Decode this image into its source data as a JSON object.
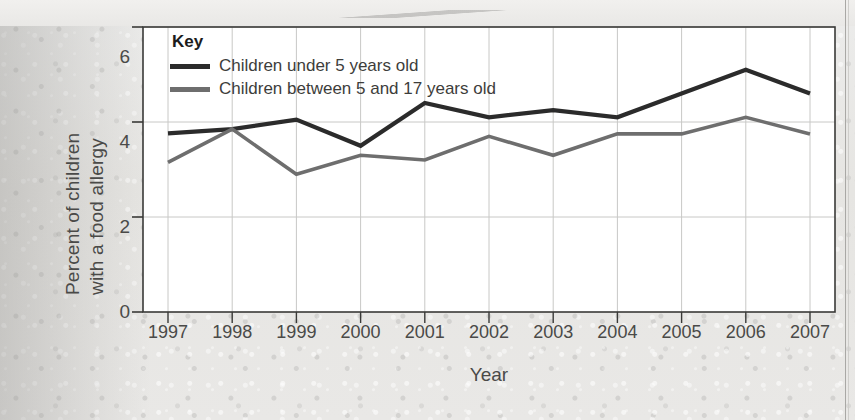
{
  "chart_data": {
    "type": "line",
    "title": "",
    "xlabel": "Year",
    "ylabel": "Percent of children with a food allergy",
    "ylabel_line1": "Percent of children",
    "ylabel_line2": "with a food allergy",
    "categories": [
      "1997",
      "1998",
      "1999",
      "2000",
      "2001",
      "2002",
      "2003",
      "2004",
      "2005",
      "2006",
      "2007"
    ],
    "x": [
      1997,
      1998,
      1999,
      2000,
      2001,
      2002,
      2003,
      2004,
      2005,
      2006,
      2007
    ],
    "ylim": [
      0,
      6
    ],
    "xlim": [
      1997,
      2007
    ],
    "yticks": [
      "0",
      "2",
      "4",
      "6"
    ],
    "ytick_values": [
      0,
      2,
      4,
      6
    ],
    "grid": "both",
    "legend_position": "top-left-inside",
    "legend_title": "Key",
    "series": [
      {
        "name": "Children under 5 years old",
        "color": "#2b2b2b",
        "values": [
          3.76,
          3.85,
          4.05,
          3.5,
          4.4,
          4.1,
          4.25,
          4.1,
          4.6,
          5.1,
          4.6
        ]
      },
      {
        "name": "Children between 5 and 17 years old",
        "color": "#6e6e6e",
        "values": [
          3.15,
          3.85,
          2.9,
          3.3,
          3.2,
          3.7,
          3.3,
          3.75,
          3.75,
          4.1,
          3.75
        ]
      }
    ]
  },
  "axis": {
    "x_label": "Year",
    "y_label_line1": "Percent of children",
    "y_label_line2": "with a food allergy"
  },
  "legend": {
    "title": "Key",
    "items": [
      {
        "label": "Children under 5 years old",
        "color": "#2b2b2b"
      },
      {
        "label": "Children between 5 and 17 years old",
        "color": "#6e6e6e"
      }
    ]
  },
  "colors": {
    "series_under5": "#2b2b2b",
    "series_5to17": "#6e6e6e",
    "grid": "#c8c8c6",
    "frame": "#3a3a38",
    "text": "#4a4a48",
    "paper": "#e8e7e4",
    "plot_background": "#ffffff"
  }
}
